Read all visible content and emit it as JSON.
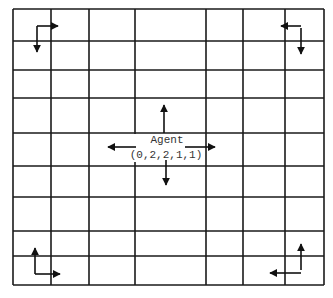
{
  "diagram": {
    "type": "grid-world",
    "grid": {
      "columns": 7,
      "rows": 9,
      "x_lines": [
        13,
        51,
        89,
        135,
        206,
        243,
        285,
        324
      ],
      "y_lines": [
        9,
        41,
        70,
        98,
        133,
        166,
        197,
        231,
        256,
        285
      ],
      "line_color": "#1a1a1a"
    },
    "agent": {
      "label": "Agent",
      "state": "(0,2,2,1,1)",
      "center": [
        165,
        147
      ],
      "actions": [
        "up",
        "down",
        "left",
        "right"
      ]
    },
    "corner_markers": [
      {
        "name": "top-left",
        "arrows": [
          "right",
          "down"
        ]
      },
      {
        "name": "top-right",
        "arrows": [
          "left",
          "down"
        ]
      },
      {
        "name": "bottom-left",
        "arrows": [
          "up",
          "right"
        ]
      },
      {
        "name": "bottom-right",
        "arrows": [
          "up",
          "left"
        ]
      }
    ]
  }
}
